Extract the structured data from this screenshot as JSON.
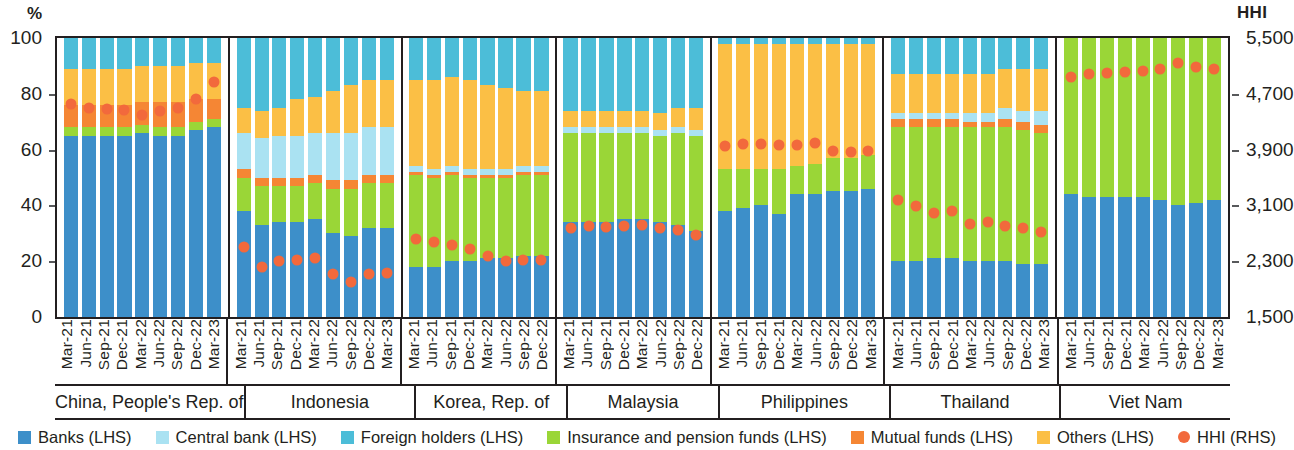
{
  "axes": {
    "left_unit": "%",
    "right_unit": "HHI",
    "left_ticks": [
      "100",
      "80",
      "60",
      "40",
      "20",
      "0"
    ],
    "right_ticks": [
      "5,500",
      "4,700",
      "3,900",
      "3,100",
      "2,300",
      "1,500"
    ]
  },
  "legend": [
    {
      "label": "Banks (LHS)",
      "color": "#3d8fc9",
      "shape": "square"
    },
    {
      "label": "Central bank (LHS)",
      "color": "#aae2f2",
      "shape": "square"
    },
    {
      "label": "Foreign holders (LHS)",
      "color": "#4cbdd8",
      "shape": "square"
    },
    {
      "label": "Insurance and pension funds (LHS)",
      "color": "#9ad637",
      "shape": "square"
    },
    {
      "label": "Mutual funds (LHS)",
      "color": "#f58634",
      "shape": "square"
    },
    {
      "label": "Others (LHS)",
      "color": "#fbbf45",
      "shape": "square"
    },
    {
      "label": "HHI (RHS)",
      "color": "#f2693c",
      "shape": "dot"
    }
  ],
  "chart_data": {
    "type": "bar",
    "subtype": "stacked-bar-with-overlay-scatter",
    "title": "",
    "xlabel": "",
    "ylabel": "%",
    "y2label": "HHI",
    "ylim": [
      0,
      100
    ],
    "y2lim": [
      1500,
      5500
    ],
    "grid": false,
    "legend_position": "bottom",
    "series_names": [
      "Banks",
      "Central bank",
      "Foreign holders",
      "Insurance and pension funds",
      "Mutual funds",
      "Others"
    ],
    "overlay_series": "HHI",
    "panels": [
      {
        "name": "China, People's Rep. of",
        "categories": [
          "Mar-21",
          "Jun-21",
          "Sep-21",
          "Dec-21",
          "Mar-22",
          "Jun-22",
          "Sep-22",
          "Dec-22",
          "Mar-23"
        ],
        "series": [
          {
            "name": "Banks",
            "values": [
              65,
              65,
              65,
              65,
              66,
              65,
              65,
              67,
              68
            ]
          },
          {
            "name": "Central bank",
            "values": [
              0,
              0,
              0,
              0,
              0,
              0,
              0,
              0,
              0
            ]
          },
          {
            "name": "Insurance and pension funds",
            "values": [
              3,
              3,
              3,
              3,
              3,
              3,
              3,
              3,
              3
            ]
          },
          {
            "name": "Mutual funds",
            "values": [
              8,
              8,
              8,
              8,
              8,
              9,
              9,
              8,
              7
            ]
          },
          {
            "name": "Others",
            "values": [
              13,
              13,
              13,
              13,
              13,
              13,
              13,
              13,
              13
            ]
          },
          {
            "name": "Foreign holders",
            "values": [
              11,
              11,
              11,
              11,
              10,
              10,
              10,
              9,
              9
            ]
          }
        ],
        "hhi": [
          4550,
          4500,
          4480,
          4470,
          4400,
          4460,
          4500,
          4620,
          4870
        ]
      },
      {
        "name": "Indonesia",
        "categories": [
          "Mar-21",
          "Jun-21",
          "Sep-21",
          "Dec-21",
          "Mar-22",
          "Jun-22",
          "Sep-22",
          "Dec-22",
          "Mar-23"
        ],
        "series": [
          {
            "name": "Banks",
            "values": [
              38,
              33,
              34,
              34,
              35,
              30,
              29,
              32,
              32
            ]
          },
          {
            "name": "Insurance and pension funds",
            "values": [
              12,
              14,
              13,
              13,
              13,
              16,
              17,
              16,
              16
            ]
          },
          {
            "name": "Mutual funds",
            "values": [
              3,
              3,
              3,
              3,
              3,
              3,
              3,
              3,
              3
            ]
          },
          {
            "name": "Central bank",
            "values": [
              13,
              14,
              15,
              15,
              15,
              17,
              17,
              17,
              17
            ]
          },
          {
            "name": "Others",
            "values": [
              9,
              10,
              10,
              13,
              13,
              15,
              17,
              17,
              17
            ]
          },
          {
            "name": "Foreign holders",
            "values": [
              25,
              26,
              25,
              22,
              21,
              19,
              17,
              15,
              15
            ]
          }
        ],
        "hhi": [
          2500,
          2220,
          2300,
          2320,
          2350,
          2120,
          2000,
          2120,
          2130
        ]
      },
      {
        "name": "Korea, Rep. of",
        "categories": [
          "Mar-21",
          "Jun-21",
          "Sep-21",
          "Dec-21",
          "Mar-22",
          "Jun-22",
          "Sep-22",
          "Dec-22"
        ],
        "series": [
          {
            "name": "Banks",
            "values": [
              18,
              18,
              20,
              20,
              21,
              21,
              22,
              22
            ]
          },
          {
            "name": "Insurance and pension funds",
            "values": [
              33,
              32,
              31,
              30,
              29,
              29,
              29,
              29
            ]
          },
          {
            "name": "Mutual funds",
            "values": [
              1,
              1,
              1,
              1,
              1,
              1,
              1,
              1
            ]
          },
          {
            "name": "Central bank",
            "values": [
              2,
              2,
              2,
              2,
              2,
              2,
              2,
              2
            ]
          },
          {
            "name": "Others",
            "values": [
              31,
              32,
              32,
              32,
              30,
              29,
              27,
              27
            ]
          },
          {
            "name": "Foreign holders",
            "values": [
              15,
              15,
              14,
              15,
              17,
              18,
              19,
              19
            ]
          }
        ],
        "hhi": [
          2620,
          2570,
          2530,
          2480,
          2380,
          2300,
          2320,
          2320
        ]
      },
      {
        "name": "Malaysia",
        "categories": [
          "Mar-21",
          "Jun-21",
          "Sep-21",
          "Dec-21",
          "Mar-22",
          "Jun-22",
          "Sep-22",
          "Dec-22"
        ],
        "series": [
          {
            "name": "Banks",
            "values": [
              34,
              34,
              34,
              35,
              35,
              34,
              33,
              31
            ]
          },
          {
            "name": "Insurance and pension funds",
            "values": [
              32,
              32,
              32,
              31,
              31,
              31,
              33,
              34
            ]
          },
          {
            "name": "Central bank",
            "values": [
              2,
              2,
              2,
              2,
              2,
              2,
              2,
              2
            ]
          },
          {
            "name": "Others",
            "values": [
              6,
              6,
              6,
              6,
              6,
              6,
              7,
              8
            ]
          },
          {
            "name": "Foreign holders",
            "values": [
              26,
              26,
              26,
              26,
              26,
              27,
              25,
              25
            ]
          }
        ],
        "hhi": [
          2780,
          2800,
          2790,
          2810,
          2820,
          2780,
          2750,
          2680
        ]
      },
      {
        "name": "Philippines",
        "categories": [
          "Mar-21",
          "Jun-21",
          "Sep-21",
          "Dec-21",
          "Mar-22",
          "Jun-22",
          "Sep-22",
          "Dec-22",
          "Mar-23"
        ],
        "series": [
          {
            "name": "Banks",
            "values": [
              38,
              39,
              40,
              37,
              44,
              44,
              45,
              45,
              46
            ]
          },
          {
            "name": "Insurance and pension funds",
            "values": [
              15,
              14,
              13,
              16,
              10,
              11,
              12,
              12,
              12
            ]
          },
          {
            "name": "Others",
            "values": [
              45,
              45,
              45,
              45,
              44,
              43,
              41,
              41,
              40
            ]
          },
          {
            "name": "Foreign holders",
            "values": [
              2,
              2,
              2,
              2,
              2,
              2,
              2,
              2,
              2
            ]
          }
        ],
        "hhi": [
          3950,
          3980,
          3980,
          3960,
          3970,
          3990,
          3880,
          3860,
          3880
        ]
      },
      {
        "name": "Thailand",
        "categories": [
          "Mar-21",
          "Jun-21",
          "Sep-21",
          "Dec-21",
          "Mar-22",
          "Jun-22",
          "Sep-22",
          "Dec-22",
          "Mar-23"
        ],
        "series": [
          {
            "name": "Banks",
            "values": [
              20,
              20,
              21,
              21,
              20,
              20,
              20,
              19,
              19
            ]
          },
          {
            "name": "Insurance and pension funds",
            "values": [
              48,
              48,
              47,
              47,
              48,
              48,
              48,
              48,
              47
            ]
          },
          {
            "name": "Mutual funds",
            "values": [
              3,
              3,
              3,
              3,
              2,
              2,
              3,
              3,
              3
            ]
          },
          {
            "name": "Central bank",
            "values": [
              2,
              2,
              2,
              2,
              3,
              3,
              4,
              4,
              5
            ]
          },
          {
            "name": "Others",
            "values": [
              14,
              14,
              14,
              14,
              14,
              14,
              14,
              15,
              15
            ]
          },
          {
            "name": "Foreign holders",
            "values": [
              13,
              13,
              13,
              13,
              13,
              13,
              11,
              11,
              11
            ]
          }
        ],
        "hhi": [
          3180,
          3090,
          2990,
          3020,
          2830,
          2860,
          2800,
          2780,
          2720
        ]
      },
      {
        "name": "Viet Nam",
        "categories": [
          "Mar-21",
          "Jun-21",
          "Sep-21",
          "Dec-21",
          "Mar-22",
          "Jun-22",
          "Sep-22",
          "Dec-22",
          "Mar-23"
        ],
        "series": [
          {
            "name": "Banks",
            "values": [
              44,
              43,
              43,
              43,
              43,
              42,
              40,
              41,
              42
            ]
          },
          {
            "name": "Insurance and pension funds",
            "values": [
              56,
              57,
              57,
              57,
              57,
              58,
              60,
              59,
              58
            ]
          }
        ],
        "hhi": [
          4940,
          4990,
          5000,
          5010,
          5020,
          5060,
          5140,
          5090,
          5060
        ]
      }
    ]
  }
}
